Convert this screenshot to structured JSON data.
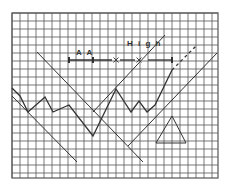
{
  "chart_data": {
    "type": "line",
    "title": "",
    "xlabel": "",
    "ylabel": "",
    "grid": true,
    "grid_box": {
      "x0": 12,
      "y0": 13,
      "x1": 218,
      "y1": 178,
      "cell": 8
    },
    "annotations": [
      {
        "text": "A A",
        "x": 76,
        "y": 55
      },
      {
        "text": "H i g h",
        "x": 127,
        "y": 46
      }
    ],
    "series": [
      {
        "name": "price",
        "style": "solid",
        "points": [
          [
            12,
            88
          ],
          [
            20,
            96
          ],
          [
            28,
            112
          ],
          [
            45,
            97
          ],
          [
            53,
            112
          ],
          [
            69,
            105
          ],
          [
            93,
            136
          ],
          [
            116,
            89
          ],
          [
            131,
            112
          ],
          [
            139,
            101
          ],
          [
            147,
            112
          ],
          [
            155,
            105
          ],
          [
            172,
            70
          ]
        ]
      },
      {
        "name": "projection",
        "style": "dashed",
        "points": [
          [
            172,
            70
          ],
          [
            196,
            46
          ]
        ]
      }
    ],
    "trendlines": [
      {
        "name": "descending-trendline-lower",
        "from": [
          12,
          96
        ],
        "to": [
          77,
          162
        ]
      },
      {
        "name": "descending-trendline-upper",
        "from": [
          37,
          52
        ],
        "to": [
          143,
          162
        ]
      },
      {
        "name": "ascending-channel-upper",
        "from": [
          93,
          112
        ],
        "to": [
          165,
          35
        ]
      },
      {
        "name": "ascending-channel-lower",
        "from": [
          128,
          146
        ],
        "to": [
          217,
          53
        ]
      }
    ],
    "measure_bar": {
      "y": 60,
      "x_start": 69,
      "x_end": 172,
      "ticks": [
        69,
        93,
        172
      ],
      "x_markers": [
        116,
        139
      ],
      "gap_after_high": [
        144,
        148
      ]
    },
    "triangle": {
      "apex": [
        172,
        116
      ],
      "base_left": [
        156,
        143
      ],
      "base_right": [
        186,
        143
      ]
    },
    "colors": {
      "grid": "#555555",
      "line": "#333333",
      "bg": "#ffffff"
    }
  }
}
